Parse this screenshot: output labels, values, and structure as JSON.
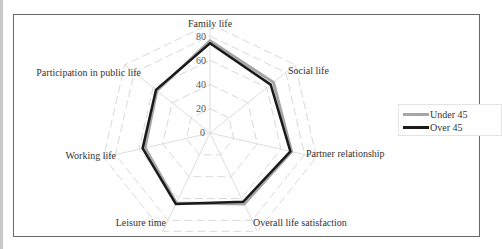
{
  "page": {
    "top_cut_text": "........................"
  },
  "chart_data": {
    "type": "radar",
    "title": "",
    "categories": [
      "Family life",
      "Social life",
      "Partner relationship",
      "Overall life satisfaction",
      "Leisure time",
      "Working life",
      "Participation in public life"
    ],
    "series": [
      {
        "name": "Under 45",
        "color": "#a6a6a6",
        "values": [
          76,
          67,
          69,
          65,
          64,
          55,
          56
        ]
      },
      {
        "name": "Over 45",
        "color": "#1a1a1a",
        "values": [
          74,
          64,
          68,
          63,
          65,
          57,
          57
        ]
      }
    ],
    "radial_ticks": [
      "0",
      "20",
      "40",
      "60",
      "80"
    ],
    "rlim": [
      0,
      80
    ],
    "grid": true,
    "grid_style": "dashed polygon",
    "legend_position": "right"
  },
  "legend": {
    "items": [
      {
        "label": "Under 45"
      },
      {
        "label": "Over 45"
      }
    ]
  }
}
